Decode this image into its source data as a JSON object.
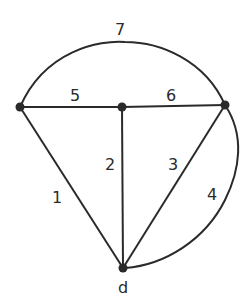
{
  "diagram": {
    "type": "graph",
    "nodes": [
      {
        "id": "left",
        "label": "",
        "x": 20,
        "y": 107
      },
      {
        "id": "mid",
        "label": "",
        "x": 122,
        "y": 107
      },
      {
        "id": "right",
        "label": "",
        "x": 225,
        "y": 105
      },
      {
        "id": "d",
        "label": "d",
        "x": 123,
        "y": 268
      }
    ],
    "edges": [
      {
        "id": "1",
        "label": "1",
        "from": "left",
        "to": "d"
      },
      {
        "id": "2",
        "label": "2",
        "from": "mid",
        "to": "d"
      },
      {
        "id": "3",
        "label": "3",
        "from": "right",
        "to": "d"
      },
      {
        "id": "4",
        "label": "4",
        "from": "right",
        "to": "d",
        "curved": true
      },
      {
        "id": "5",
        "label": "5",
        "from": "left",
        "to": "mid"
      },
      {
        "id": "6",
        "label": "6",
        "from": "mid",
        "to": "right"
      },
      {
        "id": "7",
        "label": "7",
        "from": "left",
        "to": "right",
        "curved": true
      }
    ],
    "edge_labels": {
      "e1": "1",
      "e2": "2",
      "e3": "3",
      "e4": "4",
      "e5": "5",
      "e6": "6",
      "e7": "7"
    },
    "node_labels": {
      "d": "d"
    }
  }
}
